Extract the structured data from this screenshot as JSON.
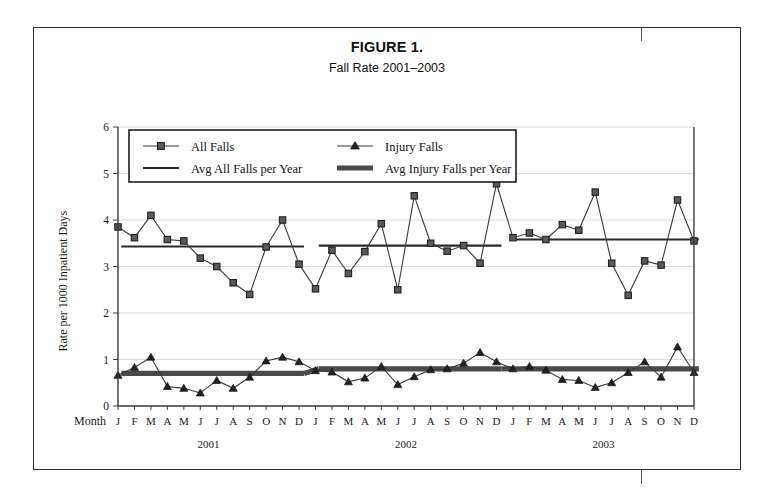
{
  "figure": {
    "label": "FIGURE 1.",
    "subtitle": "Fall Rate 2001–2003"
  },
  "axes": {
    "y_title": "Rate per 1000 Inpatient Days",
    "month_axis_label": "Month",
    "y_ticks": [
      "0",
      "1",
      "2",
      "3",
      "4",
      "5",
      "6"
    ],
    "month_ticks": [
      "J",
      "F",
      "M",
      "A",
      "M",
      "J",
      "J",
      "A",
      "S",
      "O",
      "N",
      "D"
    ],
    "year_labels": [
      "2001",
      "2002",
      "2003"
    ]
  },
  "legend": {
    "items": [
      {
        "label": "All Falls",
        "marker": "square-marker-line"
      },
      {
        "label": "Injury Falls",
        "marker": "triangle-marker-line"
      },
      {
        "label": "Avg All Falls per Year",
        "marker": "thin-line"
      },
      {
        "label": "Avg Injury Falls per Year",
        "marker": "thick-line"
      }
    ]
  },
  "chart_data": {
    "type": "line",
    "title": "Fall Rate 2001–2003",
    "xlabel": "Month",
    "ylabel": "Rate per 1000 Inpatient Days",
    "ylim": [
      0,
      6
    ],
    "grid": true,
    "legend_position": "top-inside",
    "x": [
      "2001-J",
      "2001-F",
      "2001-M",
      "2001-A",
      "2001-M",
      "2001-J",
      "2001-J",
      "2001-A",
      "2001-S",
      "2001-O",
      "2001-N",
      "2001-D",
      "2002-J",
      "2002-F",
      "2002-M",
      "2002-A",
      "2002-M",
      "2002-J",
      "2002-J",
      "2002-A",
      "2002-S",
      "2002-O",
      "2002-N",
      "2002-D",
      "2003-J",
      "2003-F",
      "2003-M",
      "2003-A",
      "2003-M",
      "2003-J",
      "2003-J",
      "2003-A",
      "2003-S",
      "2003-O",
      "2003-N",
      "2003-D"
    ],
    "series": [
      {
        "name": "All Falls",
        "values": [
          3.85,
          3.62,
          4.1,
          3.58,
          3.55,
          3.18,
          3.0,
          2.65,
          2.4,
          3.42,
          4.0,
          3.05,
          2.52,
          3.35,
          2.85,
          3.32,
          3.92,
          2.5,
          4.52,
          3.5,
          3.33,
          3.45,
          3.07,
          4.78,
          3.62,
          3.72,
          3.58,
          3.9,
          3.78,
          4.6,
          3.07,
          2.38,
          3.12,
          3.03,
          4.43,
          3.55
        ]
      },
      {
        "name": "Injury Falls",
        "values": [
          0.66,
          0.83,
          1.05,
          0.42,
          0.38,
          0.28,
          0.55,
          0.38,
          0.62,
          0.97,
          1.05,
          0.95,
          0.76,
          0.73,
          0.52,
          0.6,
          0.85,
          0.46,
          0.63,
          0.78,
          0.8,
          0.92,
          1.15,
          0.95,
          0.8,
          0.85,
          0.77,
          0.57,
          0.55,
          0.4,
          0.5,
          0.72,
          0.95,
          0.62,
          1.27,
          0.72
        ]
      }
    ],
    "averages": [
      {
        "name": "Avg All Falls per Year",
        "style": "thin",
        "values": [
          3.43,
          3.45,
          3.58
        ]
      },
      {
        "name": "Avg Injury Falls per Year",
        "style": "thick",
        "values": [
          0.7,
          0.8,
          0.8
        ]
      }
    ]
  }
}
